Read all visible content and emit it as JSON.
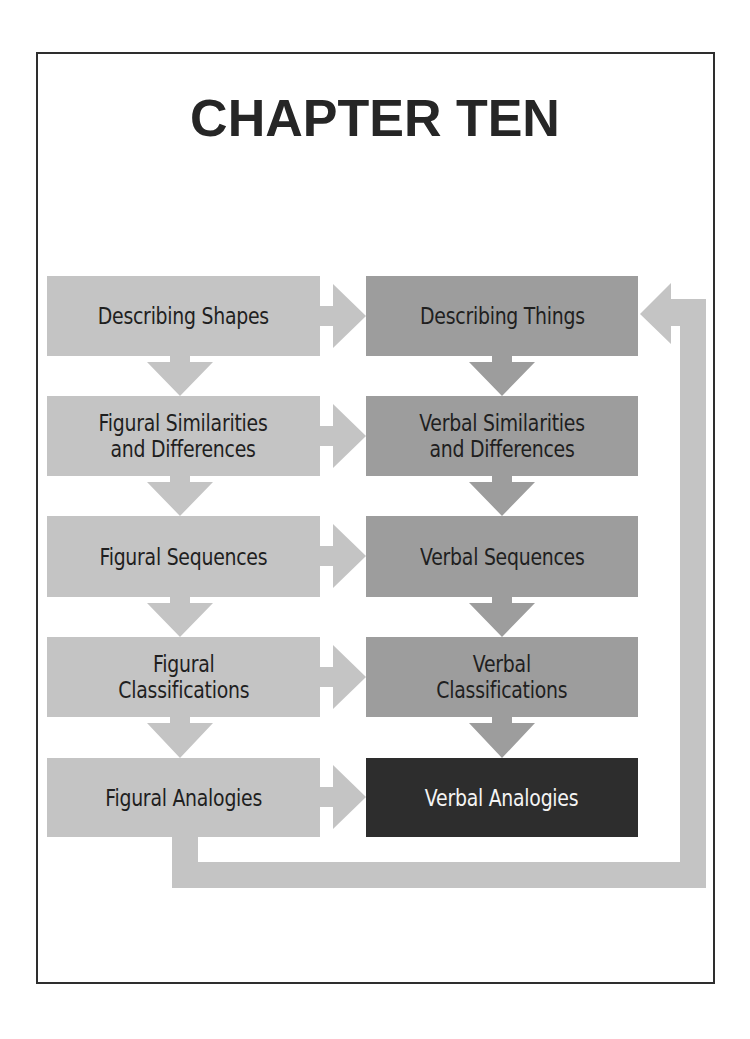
{
  "page": {
    "title": "CHAPTER TEN"
  },
  "diagram": {
    "left_column": [
      {
        "label": "Describing Shapes"
      },
      {
        "label": "Figural Similarities\nand Differences"
      },
      {
        "label": "Figural Sequences"
      },
      {
        "label": "Figural\nClassifications"
      },
      {
        "label": "Figural Analogies"
      }
    ],
    "right_column": [
      {
        "label": "Describing Things"
      },
      {
        "label": "Verbal Similarities\nand Differences"
      },
      {
        "label": "Verbal Sequences"
      },
      {
        "label": "Verbal\nClassifications"
      },
      {
        "label": "Verbal Analogies",
        "highlighted": true
      }
    ],
    "colors": {
      "figural_box": "#c4c4c4",
      "verbal_box": "#9d9d9d",
      "highlight_box": "#2d2d2d",
      "arrow": "#c4c4c4",
      "verbal_arrow": "#9d9d9d",
      "frame": "#2e2e2e"
    },
    "connections": [
      {
        "from": "Describing Shapes",
        "to": "Describing Things"
      },
      {
        "from": "Figural Similarities and Differences",
        "to": "Verbal Similarities and Differences"
      },
      {
        "from": "Figural Sequences",
        "to": "Verbal Sequences"
      },
      {
        "from": "Figural Classifications",
        "to": "Verbal Classifications"
      },
      {
        "from": "Figural Analogies",
        "to": "Verbal Analogies"
      },
      {
        "from": "Figural Analogies",
        "to": "Describing Things",
        "type": "feedback-loop"
      }
    ]
  }
}
